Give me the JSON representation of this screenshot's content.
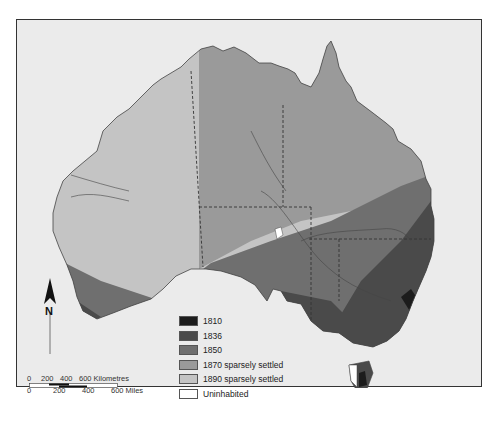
{
  "map": {
    "title": "",
    "legend": [
      {
        "label": "1810",
        "color": "#1c1c1c"
      },
      {
        "label": "1836",
        "color": "#4a4a4a"
      },
      {
        "label": "1850",
        "color": "#6f6f6f"
      },
      {
        "label": "1870 sparsely settled",
        "color": "#9a9a9a"
      },
      {
        "label": "1890 sparsely settled",
        "color": "#c4c4c4"
      },
      {
        "label": "Uninhabited",
        "color": "#ffffff"
      }
    ],
    "north_arrow": {
      "label": "N"
    },
    "scale_bar": {
      "km_labels": [
        "0",
        "200",
        "400",
        "600 Kilometres"
      ],
      "mile_labels": [
        "0",
        "200",
        "400",
        "600 Miles"
      ]
    },
    "colors": {
      "background": "#ebebeb",
      "border": "#333333",
      "water": "#ebebeb"
    }
  }
}
